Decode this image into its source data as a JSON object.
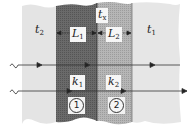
{
  "diagram": {
    "type": "composite-wall-heat-conduction",
    "colors": {
      "fluid": "#e6e6e6",
      "slab1": "#6a6a6a",
      "slab2": "#b4b4b4",
      "line": "#333333"
    },
    "labels": {
      "t2": {
        "base": "t",
        "sub": "2"
      },
      "t1": {
        "base": "t",
        "sub": "1"
      },
      "tx": {
        "base": "t",
        "sub": "x"
      },
      "L1": {
        "base": "L",
        "sub": "1"
      },
      "L2": {
        "base": "L",
        "sub": "2"
      },
      "k1": {
        "base": "k",
        "sub": "1"
      },
      "k2": {
        "base": "k",
        "sub": "2"
      }
    },
    "layers": [
      {
        "id": "1",
        "marker": "1",
        "thickness_label": "L1",
        "conductivity_label": "k1"
      },
      {
        "id": "2",
        "marker": "2",
        "thickness_label": "L2",
        "conductivity_label": "k2"
      }
    ],
    "rays": [
      {
        "name": "ray-upper",
        "direction": "right"
      },
      {
        "name": "ray-lower",
        "direction": "right"
      }
    ]
  }
}
